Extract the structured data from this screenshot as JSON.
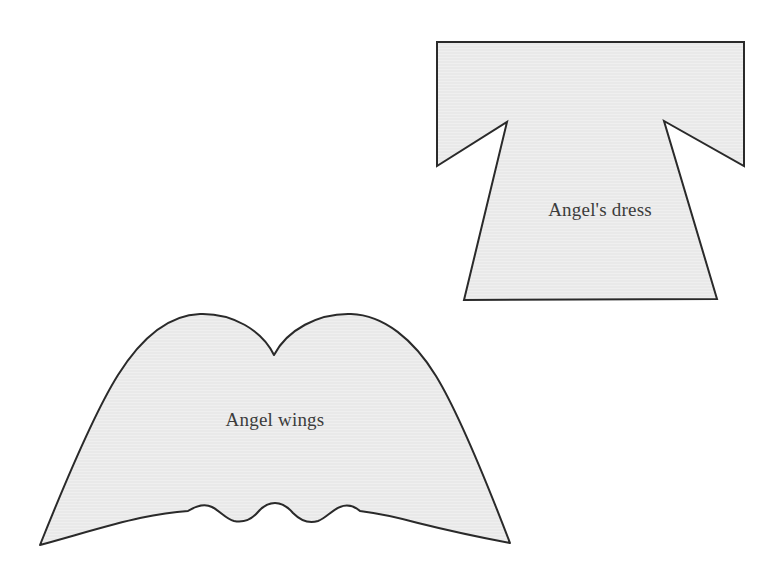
{
  "page": {
    "background_color": "#ffffff",
    "width": 775,
    "height": 582
  },
  "style": {
    "shape_fill": "#e9e9e9",
    "shape_stroke": "#2a2a2a",
    "stroke_width": 2,
    "label_color": "#3c3c3c",
    "texture": "horizontal-scanlines"
  },
  "shapes": [
    {
      "id": "dress",
      "name": "angel-dress-pattern",
      "label": "Angel's dress",
      "label_x": 600,
      "label_y": 212,
      "description": "Kimono-style tunic outline with flared skirt and two triangular underarm notches",
      "bounds": {
        "x": 437,
        "y": 42,
        "width": 307,
        "height": 258
      }
    },
    {
      "id": "wings",
      "name": "angel-wings-pattern",
      "label": "Angel wings",
      "label_x": 275,
      "label_y": 422,
      "description": "Double-humped wing outline with scalloped lower edge and pointed outer tips",
      "bounds": {
        "x": 40,
        "y": 313,
        "width": 470,
        "height": 232
      }
    }
  ]
}
